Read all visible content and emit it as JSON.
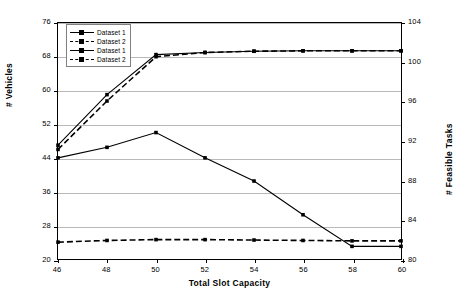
{
  "chart_data": {
    "type": "line",
    "title": "",
    "xlabel": "Total Slot Capacity",
    "ylabel": "# Vehicles",
    "y2label": "# Feasible Tasks",
    "x": [
      46,
      48,
      50,
      52,
      54,
      56,
      58,
      60
    ],
    "xlim": [
      46,
      60
    ],
    "xticks": [
      46,
      48,
      50,
      52,
      54,
      56,
      58,
      60
    ],
    "ylim": [
      20,
      76
    ],
    "yticks": [
      20,
      28,
      36,
      44,
      52,
      60,
      68,
      76
    ],
    "y2lim": [
      80,
      104
    ],
    "y2ticks": [
      80,
      84,
      88,
      92,
      96,
      100,
      104
    ],
    "grid": true,
    "legend_position": "upper-left",
    "series": [
      {
        "name": "Dataset 1",
        "axis": "left",
        "style": "solid",
        "marker": "square",
        "values": [
          47.0,
          59.0,
          68.5,
          69.0,
          69.3,
          69.4,
          69.4,
          69.4
        ]
      },
      {
        "name": "Dataset 2",
        "axis": "left",
        "style": "dashed",
        "marker": "square",
        "values": [
          46.0,
          57.5,
          68.0,
          69.0,
          69.3,
          69.4,
          69.4,
          69.4
        ]
      },
      {
        "name": "Dataset 1",
        "axis": "left",
        "style": "solid",
        "marker": "square",
        "values": [
          44.0,
          46.5,
          50.0,
          44.0,
          38.5,
          30.5,
          23.0,
          23.0
        ]
      },
      {
        "name": "Dataset 2",
        "axis": "left",
        "style": "dashed",
        "marker": "square",
        "values": [
          24.0,
          24.4,
          24.6,
          24.6,
          24.5,
          24.4,
          24.3,
          24.3
        ]
      }
    ]
  },
  "axes": {
    "x_title": "Total Slot Capacity",
    "y_left_title": "# Vehicles",
    "y_right_title": "# Feasible Tasks",
    "x_ticks": [
      "46",
      "48",
      "50",
      "52",
      "54",
      "56",
      "58",
      "60"
    ],
    "y_left_ticks": [
      "76",
      "68",
      "60",
      "52",
      "44",
      "36",
      "28",
      "20"
    ],
    "y_right_ticks": [
      "104",
      "100",
      "96",
      "92",
      "88",
      "84",
      "80"
    ]
  },
  "legend": {
    "items": [
      {
        "label": "Dataset 1",
        "style": "solid"
      },
      {
        "label": "Dataset 2",
        "style": "dashed"
      },
      {
        "label": "Dataset 1",
        "style": "solid"
      },
      {
        "label": "Dataset 2",
        "style": "dashed"
      }
    ]
  },
  "colors": {
    "line": "#000000",
    "grid": "#b9b9b9",
    "frame": "#000000",
    "background": "#ffffff"
  }
}
